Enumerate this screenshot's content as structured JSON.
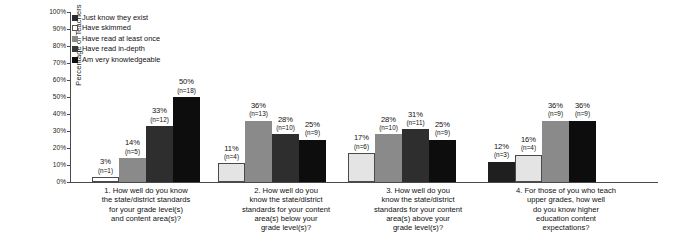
{
  "chart_data": {
    "type": "bar",
    "title": "",
    "xlabel": "",
    "ylabel": "Percentage of Teachers",
    "ylim": [
      0,
      100
    ],
    "grid": false,
    "legend_position": "top-left",
    "y_ticks": [
      "0%",
      "10%",
      "20%",
      "30%",
      "40%",
      "50%",
      "60%",
      "70%",
      "80%",
      "90%",
      "100%"
    ],
    "y_tick_values": [
      0,
      10,
      20,
      30,
      40,
      50,
      60,
      70,
      80,
      90,
      100
    ],
    "legend": [
      {
        "label": "Just know they exist",
        "color": "#2b2b2b"
      },
      {
        "label": "Have skimmed",
        "color": "#ffffff"
      },
      {
        "label": "Have read at least once",
        "color": "#8a8a8a"
      },
      {
        "label": "Have read in-depth",
        "color": "#3a3a3a"
      },
      {
        "label": "Am very knowledgeable",
        "color": "#0d0d0d"
      }
    ],
    "categories": [
      "1. How well do you know the state/district standards for your grade level(s) and content area(s)?",
      "2. How well do you know the state/district standards for your content area(s) below your grade level(s)?",
      "3. How well do you know the state/district standards for your content area(s) above your grade level(s)?",
      "4. For those of you who teach upper grades, how well do you know higher education content expectations?"
    ],
    "category_lines": [
      [
        "1. How well do you know",
        "the state/district standards",
        "for your grade level(s)",
        "and content area(s)?"
      ],
      [
        "2. How well do you",
        "know the state/district",
        "standards for your content",
        "area(s) below your",
        "grade level(s)?"
      ],
      [
        "3. How well do you",
        "know the state/district",
        "standards for your content",
        "area(s) above your",
        "grade level(s)?"
      ],
      [
        "4. For those of you who teach",
        "upper grades, how well",
        "do you know higher",
        "education content",
        "expectations?"
      ]
    ],
    "groups": [
      {
        "name": "group-1",
        "bars": [
          {
            "series": "Have skimmed",
            "value": 3,
            "pct_label": "3%",
            "n_label": "(n=1)",
            "n": 1,
            "color": "#ffffff"
          },
          {
            "series": "Have read at least once",
            "value": 14,
            "pct_label": "14%",
            "n_label": "(n=5)",
            "n": 5,
            "color": "#8a8a8a"
          },
          {
            "series": "Have read in-depth",
            "value": 33,
            "pct_label": "33%",
            "n_label": "(n=12)",
            "n": 12,
            "color": "#2e2e2e"
          },
          {
            "series": "Am very knowledgeable",
            "value": 50,
            "pct_label": "50%",
            "n_label": "(n=18)",
            "n": 18,
            "color": "#0d0d0d"
          }
        ]
      },
      {
        "name": "group-2",
        "bars": [
          {
            "series": "Have skimmed",
            "value": 11,
            "pct_label": "11%",
            "n_label": "(n=4)",
            "n": 4,
            "color": "#e4e4e4"
          },
          {
            "series": "Have read at least once",
            "value": 36,
            "pct_label": "36%",
            "n_label": "(n=13)",
            "n": 13,
            "color": "#8a8a8a"
          },
          {
            "series": "Have read in-depth",
            "value": 28,
            "pct_label": "28%",
            "n_label": "(n=10)",
            "n": 10,
            "color": "#2e2e2e"
          },
          {
            "series": "Am very knowledgeable",
            "value": 25,
            "pct_label": "25%",
            "n_label": "(n=9)",
            "n": 9,
            "color": "#0d0d0d"
          }
        ]
      },
      {
        "name": "group-3",
        "bars": [
          {
            "series": "Have skimmed",
            "value": 17,
            "pct_label": "17%",
            "n_label": "(n=6)",
            "n": 6,
            "color": "#e4e4e4"
          },
          {
            "series": "Have read at least once",
            "value": 28,
            "pct_label": "28%",
            "n_label": "(n=10)",
            "n": 10,
            "color": "#8a8a8a"
          },
          {
            "series": "Have read in-depth",
            "value": 31,
            "pct_label": "31%",
            "n_label": "(n=11)",
            "n": 11,
            "color": "#2e2e2e"
          },
          {
            "series": "Am very knowledgeable",
            "value": 25,
            "pct_label": "25%",
            "n_label": "(n=9)",
            "n": 9,
            "color": "#0d0d0d"
          }
        ]
      },
      {
        "name": "group-4",
        "bars": [
          {
            "series": "Just know they exist",
            "value": 12,
            "pct_label": "12%",
            "n_label": "(n=3)",
            "n": 3,
            "color": "#1f1f1f"
          },
          {
            "series": "Have skimmed",
            "value": 16,
            "pct_label": "16%",
            "n_label": "(n=4)",
            "n": 4,
            "color": "#e4e4e4"
          },
          {
            "series": "Have read at least once",
            "value": 36,
            "pct_label": "36%",
            "n_label": "(n=9)",
            "n": 9,
            "color": "#8a8a8a"
          },
          {
            "series": "Am very knowledgeable",
            "value": 36,
            "pct_label": "36%",
            "n_label": "(n=9)",
            "n": 9,
            "color": "#0d0d0d"
          }
        ]
      }
    ]
  }
}
